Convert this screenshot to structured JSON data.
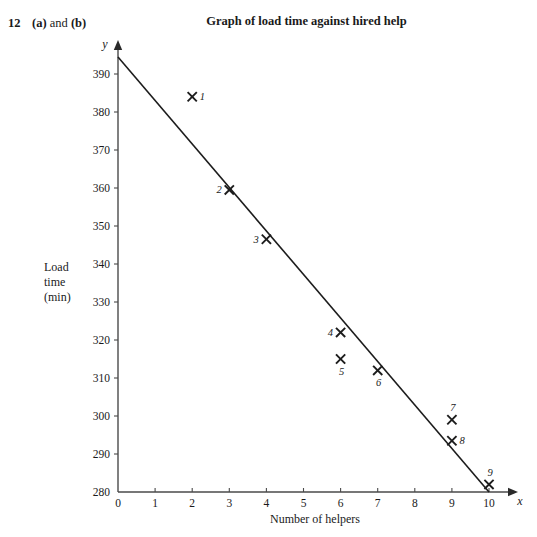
{
  "question": {
    "number": "12",
    "parts_prefix": "(a)",
    "parts_middle": "and",
    "parts_suffix": "(b)"
  },
  "chart_data": {
    "type": "scatter",
    "title": "Graph of load time against hired help",
    "xlabel": "Number of helpers",
    "ylabel_lines": [
      "Load",
      "time",
      "(min)"
    ],
    "x_axis_symbol": "x",
    "y_axis_symbol": "y",
    "xlim": [
      0,
      10.6
    ],
    "ylim": [
      280,
      396
    ],
    "xticks": [
      "0",
      "1",
      "2",
      "3",
      "4",
      "5",
      "6",
      "7",
      "8",
      "9",
      "10"
    ],
    "xtick_values": [
      0,
      1,
      2,
      3,
      4,
      5,
      6,
      7,
      8,
      9,
      10
    ],
    "yticks": [
      "280",
      "290",
      "300",
      "310",
      "320",
      "330",
      "340",
      "350",
      "360",
      "370",
      "380",
      "390"
    ],
    "ytick_values": [
      280,
      290,
      300,
      310,
      320,
      330,
      340,
      350,
      360,
      370,
      380,
      390
    ],
    "grid": false,
    "legend": "none",
    "marker": "cross",
    "point_label_style": "italic-number",
    "points": [
      {
        "label": "1",
        "x": 2,
        "y": 384,
        "label_pos": "right"
      },
      {
        "label": "2",
        "x": 3,
        "y": 359.5,
        "label_pos": "left"
      },
      {
        "label": "3",
        "x": 4,
        "y": 346.5,
        "label_pos": "left"
      },
      {
        "label": "4",
        "x": 6,
        "y": 322,
        "label_pos": "left"
      },
      {
        "label": "5",
        "x": 6,
        "y": 315,
        "label_pos": "below"
      },
      {
        "label": "6",
        "x": 7,
        "y": 312,
        "label_pos": "below"
      },
      {
        "label": "7",
        "x": 9,
        "y": 299,
        "label_pos": "above"
      },
      {
        "label": "8",
        "x": 9,
        "y": 293.5,
        "label_pos": "right"
      },
      {
        "label": "9",
        "x": 10,
        "y": 282,
        "label_pos": "above"
      }
    ],
    "trend_line": {
      "name": "line of best fit",
      "x_start": 0,
      "y_start": 394.5,
      "x_end": 10,
      "y_end": 280
    }
  }
}
